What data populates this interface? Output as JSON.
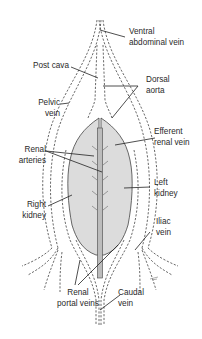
{
  "diagram": {
    "colors": {
      "line": "#333333",
      "kidney_fill": "#dcdcdc",
      "aorta_fill": "#bcbcbc",
      "background": "#ffffff"
    },
    "labels": {
      "ventral_abdominal_vein": {
        "line1": "Ventral",
        "line2": "abdominal vein"
      },
      "post_cava": {
        "line1": "Post cava"
      },
      "dorsal_aorta": {
        "line1": "Dorsal",
        "line2": "aorta"
      },
      "pelvic_vein": {
        "line1": "Pelvic",
        "line2": "vein"
      },
      "efferent_renal_vein": {
        "line1": "Efferent",
        "line2": "renal vein"
      },
      "renal_arteries": {
        "line1": "Renal",
        "line2": "arteries"
      },
      "left_kidney": {
        "line1": "Left",
        "line2": "kidney"
      },
      "right_kidney": {
        "line1": "Right",
        "line2": "kidney"
      },
      "iliac_vein": {
        "line1": "Iliac",
        "line2": "vein"
      },
      "renal_portal_veins": {
        "line1": "Renal",
        "line2": "portal veins"
      },
      "caudal_vein": {
        "line1": "Caudal",
        "line2": "vein"
      }
    }
  }
}
